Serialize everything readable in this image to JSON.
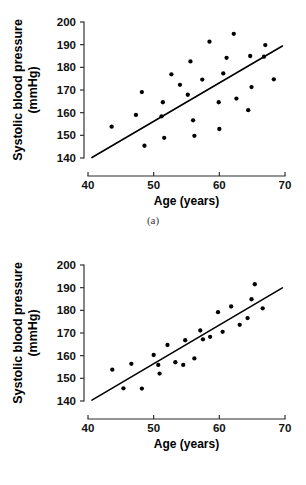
{
  "figure": {
    "panels": [
      {
        "id": "a",
        "caption": "(a)",
        "chart_ref": 0
      },
      {
        "id": "b",
        "caption": "(b)",
        "chart_ref": 1
      }
    ]
  },
  "axes": {
    "xlabel": "Age (years)",
    "ylabel_line1": "Systolic blood pressure",
    "ylabel_line2": "(mmHg)",
    "xticks": [
      "40",
      "50",
      "60",
      "70"
    ],
    "yticks": [
      "140",
      "150",
      "160",
      "170",
      "180",
      "190",
      "200"
    ]
  },
  "chart_data": [
    {
      "type": "scatter",
      "title": "(a)",
      "xlabel": "Age (years)",
      "ylabel": "Systolic blood pressure (mmHg)",
      "xlim": [
        40,
        70
      ],
      "ylim": [
        140,
        200
      ],
      "xticks": [
        40,
        50,
        60,
        70
      ],
      "yticks": [
        140,
        150,
        160,
        170,
        180,
        190,
        200
      ],
      "grid": false,
      "legend": null,
      "correlation_strength": "weak-moderate (wide scatter)",
      "points": [
        {
          "x": 43.6,
          "y": 153.8
        },
        {
          "x": 47.3,
          "y": 159.0
        },
        {
          "x": 48.2,
          "y": 169.1
        },
        {
          "x": 48.6,
          "y": 145.4
        },
        {
          "x": 51.2,
          "y": 158.4
        },
        {
          "x": 51.4,
          "y": 164.6
        },
        {
          "x": 51.6,
          "y": 148.9
        },
        {
          "x": 52.7,
          "y": 176.9
        },
        {
          "x": 54.0,
          "y": 172.3
        },
        {
          "x": 55.2,
          "y": 167.9
        },
        {
          "x": 55.6,
          "y": 182.6
        },
        {
          "x": 56.0,
          "y": 156.6
        },
        {
          "x": 56.2,
          "y": 149.8
        },
        {
          "x": 57.4,
          "y": 174.6
        },
        {
          "x": 58.5,
          "y": 191.3
        },
        {
          "x": 59.9,
          "y": 164.6
        },
        {
          "x": 60.0,
          "y": 152.8
        },
        {
          "x": 60.6,
          "y": 177.3
        },
        {
          "x": 61.1,
          "y": 184.2
        },
        {
          "x": 62.2,
          "y": 194.8
        },
        {
          "x": 62.6,
          "y": 166.2
        },
        {
          "x": 64.4,
          "y": 161.1
        },
        {
          "x": 64.7,
          "y": 185.0
        },
        {
          "x": 64.9,
          "y": 171.3
        },
        {
          "x": 66.8,
          "y": 184.7
        },
        {
          "x": 67.0,
          "y": 189.8
        },
        {
          "x": 68.3,
          "y": 174.7
        }
      ],
      "fit_line": {
        "x1": 40.6,
        "y1": 140.2,
        "x2": 69.6,
        "y2": 189.4
      }
    },
    {
      "type": "scatter",
      "title": "(b)",
      "xlabel": "Age (years)",
      "ylabel": "Systolic blood pressure (mmHg)",
      "xlim": [
        40,
        70
      ],
      "ylim": [
        140,
        200
      ],
      "xticks": [
        40,
        50,
        60,
        70
      ],
      "yticks": [
        140,
        150,
        160,
        170,
        180,
        190,
        200
      ],
      "grid": false,
      "legend": null,
      "correlation_strength": "strong (tight scatter)",
      "points": [
        {
          "x": 43.7,
          "y": 153.8
        },
        {
          "x": 45.4,
          "y": 145.6
        },
        {
          "x": 46.6,
          "y": 156.4
        },
        {
          "x": 48.2,
          "y": 145.5
        },
        {
          "x": 50.0,
          "y": 160.3
        },
        {
          "x": 50.7,
          "y": 155.9
        },
        {
          "x": 50.9,
          "y": 152.1
        },
        {
          "x": 52.1,
          "y": 164.7
        },
        {
          "x": 53.3,
          "y": 157.1
        },
        {
          "x": 54.5,
          "y": 155.9
        },
        {
          "x": 54.8,
          "y": 166.8
        },
        {
          "x": 56.2,
          "y": 158.8
        },
        {
          "x": 57.1,
          "y": 171.1
        },
        {
          "x": 57.5,
          "y": 167.2
        },
        {
          "x": 58.6,
          "y": 168.3
        },
        {
          "x": 59.8,
          "y": 179.2
        },
        {
          "x": 60.5,
          "y": 170.5
        },
        {
          "x": 61.8,
          "y": 181.7
        },
        {
          "x": 63.1,
          "y": 173.6
        },
        {
          "x": 64.3,
          "y": 176.6
        },
        {
          "x": 64.9,
          "y": 184.9
        },
        {
          "x": 65.4,
          "y": 191.5
        },
        {
          "x": 66.6,
          "y": 180.9
        }
      ],
      "fit_line": {
        "x1": 40.6,
        "y1": 140.4,
        "x2": 69.6,
        "y2": 189.9
      }
    }
  ]
}
